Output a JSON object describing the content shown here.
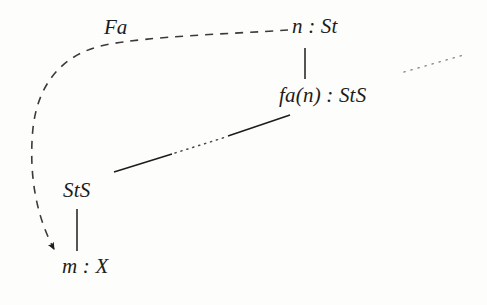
{
  "figure": {
    "kind": "commutative-diagram",
    "background_color": "#fdfdfb",
    "ink_color": "#1c1c1c"
  },
  "nodes": [
    {
      "id": "n-st",
      "text": "n : St",
      "x": 295,
      "y": 28
    },
    {
      "id": "fa-n",
      "text": "fa(n) : StS",
      "x": 290,
      "y": 97
    },
    {
      "id": "sts",
      "text": "StS",
      "x": 68,
      "y": 192
    },
    {
      "id": "m-x",
      "text": "m : X",
      "x": 68,
      "y": 268
    }
  ],
  "edge_labels": [
    {
      "id": "fa",
      "text": "Fa",
      "x": 103,
      "y": 28
    }
  ],
  "edges": [
    {
      "id": "dashed-curve",
      "style": "dashed",
      "arrowhead": "filled-triangle",
      "from": "n-st",
      "to": "m-x",
      "label": "Fa"
    },
    {
      "id": "vertical-n-to-fan",
      "style": "solid",
      "from": "n-st",
      "to": "fa-n"
    },
    {
      "id": "vertical-sts-to-mx",
      "style": "solid",
      "arrowhead": "none",
      "from": "sts",
      "to": "m-x"
    },
    {
      "id": "diagonal-sts-to-fan",
      "style": "solid-with-dotted-gap",
      "from": "sts",
      "to": "fa-n"
    },
    {
      "id": "dotted-stub-top-right",
      "style": "dotted",
      "from": null,
      "to": null
    }
  ]
}
